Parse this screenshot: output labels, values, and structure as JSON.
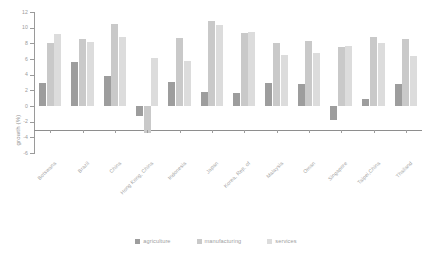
{
  "chart_data": {
    "type": "bar",
    "title": "",
    "xlabel": "",
    "ylabel": "growth (%)",
    "ylim": [
      -6,
      12
    ],
    "yticks": [
      12,
      10,
      8,
      6,
      4,
      2,
      0,
      -2,
      -4,
      -6
    ],
    "grid": false,
    "legend_position": "bottom",
    "categories": [
      "Botswana",
      "Brazil",
      "China",
      "Hong Kong, China",
      "Indonesia",
      "Japan",
      "Korea, Rep. of",
      "Malaysia",
      "Oman",
      "Singapore",
      "Taipei,China",
      "Thailand"
    ],
    "series": [
      {
        "name": "agriculture",
        "color": "#9d9d9d",
        "values": [
          2.9,
          5.6,
          3.8,
          -1.3,
          3.1,
          1.8,
          1.6,
          2.9,
          2.8,
          -1.8,
          0.9,
          2.8
        ]
      },
      {
        "name": "manufacturing",
        "color": "#c9c9c9",
        "values": [
          8.0,
          8.5,
          10.5,
          -3.5,
          8.7,
          10.8,
          9.3,
          8.0,
          8.3,
          7.5,
          8.8,
          8.5
        ]
      },
      {
        "name": "services",
        "color": "#dcdcdc",
        "values": [
          9.2,
          8.2,
          8.8,
          6.1,
          5.8,
          10.3,
          9.5,
          6.5,
          6.8,
          7.6,
          8.1,
          6.4
        ]
      }
    ]
  },
  "legend": {
    "items": [
      {
        "label": "agriculture"
      },
      {
        "label": "manufacturing"
      },
      {
        "label": "services"
      }
    ]
  }
}
